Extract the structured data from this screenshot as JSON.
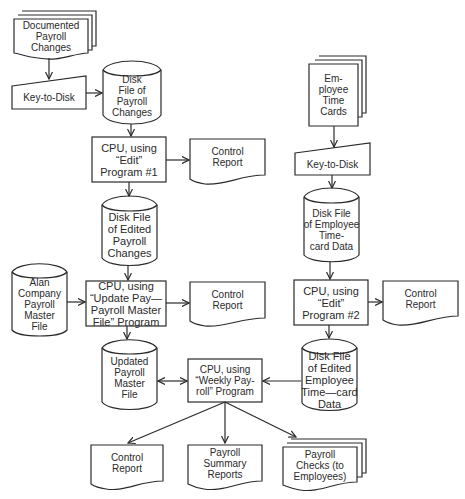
{
  "diagram": {
    "type": "system flowchart",
    "nodes": {
      "documented_payroll_changes": "Documented\nPayroll\nChanges",
      "key_to_disk_1": "Key-to-Disk",
      "disk_file_payroll_changes": "Disk\nFile of\nPayroll\nChanges",
      "cpu_edit_1": "CPU, using\n“Edit”\nProgram #1",
      "control_report_1": "Control\nReport",
      "disk_file_edited_payroll_changes": "Disk File\nof Edited\nPayroll\nChanges",
      "alan_company_master_file": "Alan\nCompany\nPayroll\nMaster\nFile",
      "cpu_update_master": "CPU, using\n“Update Pay—\nPayroll Master\nFile” Program",
      "control_report_2": "Control\nReport",
      "updated_payroll_master_file": "Updated\nPayroll\nMaster\nFile",
      "cpu_weekly_payroll": "CPU, using\n“Weekly Pay-\nroll” Program",
      "employee_time_cards": "Em-\nployee\nTime\nCards",
      "key_to_disk_2": "Key-to-Disk",
      "disk_file_employee_timecard": "Disk File\nof Employee\nTime-\ncard Data",
      "cpu_edit_2": "CPU, using\n“Edit”\nProgram #2",
      "control_report_3": "Control\nReport",
      "disk_file_edited_employee_timecard": "Disk File\nof Edited\nEmployee\nTime—card\nData",
      "control_report_4": "Control\nReport",
      "payroll_summary_reports": "Payroll\nSummary\nReports",
      "payroll_checks": "Payroll\nChecks (to\nEmployees)"
    },
    "edges": [
      {
        "from": "documented_payroll_changes",
        "to": "key_to_disk_1"
      },
      {
        "from": "key_to_disk_1",
        "to": "disk_file_payroll_changes"
      },
      {
        "from": "disk_file_payroll_changes",
        "to": "cpu_edit_1"
      },
      {
        "from": "cpu_edit_1",
        "to": "control_report_1"
      },
      {
        "from": "cpu_edit_1",
        "to": "disk_file_edited_payroll_changes"
      },
      {
        "from": "disk_file_edited_payroll_changes",
        "to": "cpu_update_master"
      },
      {
        "from": "alan_company_master_file",
        "to": "cpu_update_master"
      },
      {
        "from": "cpu_update_master",
        "to": "control_report_2"
      },
      {
        "from": "cpu_update_master",
        "to": "updated_payroll_master_file"
      },
      {
        "from": "updated_payroll_master_file",
        "to": "cpu_weekly_payroll",
        "bidirectional": true
      },
      {
        "from": "employee_time_cards",
        "to": "key_to_disk_2"
      },
      {
        "from": "key_to_disk_2",
        "to": "disk_file_employee_timecard"
      },
      {
        "from": "disk_file_employee_timecard",
        "to": "cpu_edit_2"
      },
      {
        "from": "cpu_edit_2",
        "to": "control_report_3"
      },
      {
        "from": "cpu_edit_2",
        "to": "disk_file_edited_employee_timecard"
      },
      {
        "from": "disk_file_edited_employee_timecard",
        "to": "cpu_weekly_payroll"
      },
      {
        "from": "cpu_weekly_payroll",
        "to": "control_report_4"
      },
      {
        "from": "cpu_weekly_payroll",
        "to": "payroll_summary_reports"
      },
      {
        "from": "cpu_weekly_payroll",
        "to": "payroll_checks"
      }
    ],
    "colors": {
      "stroke": "#2a2a2a",
      "background": "#ffffff"
    }
  }
}
